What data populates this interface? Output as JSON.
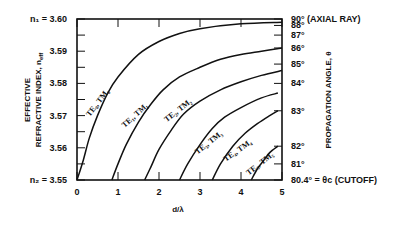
{
  "chart_data": {
    "type": "line",
    "title": "",
    "xlabel": "d/λ",
    "ylabel": "EFFECTIVE REFRACTIVE INDEX, n_eff",
    "ylabel_line1": "EFFECTIVE",
    "ylabel_line2": "REFRACTIVE INDEX, n",
    "ylabel_sub": "eff",
    "y2label": "PROPAGATION ANGLE, θ",
    "xlim": [
      0,
      5
    ],
    "ylim": [
      3.55,
      3.6
    ],
    "x_ticks": [
      0,
      1,
      2,
      3,
      4,
      5
    ],
    "x_tick_labels": [
      "0",
      "1",
      "2",
      "3",
      "4",
      "5"
    ],
    "y_ticks": [
      3.55,
      3.56,
      3.57,
      3.58,
      3.59,
      3.6
    ],
    "y_tick_labels": [
      "n₂ = 3.55",
      "3.56",
      "3.57",
      "3.58",
      "3.59",
      "n₁ = 3.60"
    ],
    "y2_ticks": [
      {
        "angle": 90,
        "n": 3.6,
        "label": "90° (AXIAL RAY)"
      },
      {
        "angle": 88,
        "n": 3.598,
        "label": "88°"
      },
      {
        "angle": 87,
        "n": 3.595,
        "label": "87°"
      },
      {
        "angle": 86,
        "n": 3.591,
        "label": "86°"
      },
      {
        "angle": 85,
        "n": 3.586,
        "label": "85°"
      },
      {
        "angle": 84,
        "n": 3.58,
        "label": "84°"
      },
      {
        "angle": 83,
        "n": 3.5715,
        "label": "83°"
      },
      {
        "angle": 82,
        "n": 3.5605,
        "label": "82°"
      },
      {
        "angle": 81,
        "n": 3.555,
        "label": "81°"
      },
      {
        "angle": 80.4,
        "n": 3.55,
        "label": "80.4° = θc  (CUTOFF)"
      }
    ],
    "grid": false,
    "series": [
      {
        "name": "TE₀, TM₀",
        "x": [
          0,
          0.15,
          0.3,
          0.5,
          0.75,
          1.0,
          1.5,
          2.0,
          2.5,
          3.0,
          4.0,
          5.0
        ],
        "y": [
          3.55,
          3.556,
          3.563,
          3.57,
          3.577,
          3.582,
          3.589,
          3.593,
          3.5955,
          3.597,
          3.5985,
          3.599
        ]
      },
      {
        "name": "TE₁, TM₁",
        "x": [
          0.85,
          1.0,
          1.2,
          1.5,
          1.8,
          2.1,
          2.5,
          3.0,
          3.5,
          4.0,
          4.5,
          5.0
        ],
        "y": [
          3.55,
          3.555,
          3.561,
          3.568,
          3.5735,
          3.578,
          3.582,
          3.585,
          3.5875,
          3.589,
          3.59,
          3.591
        ]
      },
      {
        "name": "TE₂, TM₂",
        "x": [
          1.65,
          1.8,
          2.0,
          2.3,
          2.6,
          3.0,
          3.5,
          4.0,
          4.5,
          5.0
        ],
        "y": [
          3.55,
          3.554,
          3.5595,
          3.5655,
          3.5705,
          3.5745,
          3.578,
          3.5805,
          3.5825,
          3.584
        ]
      },
      {
        "name": "TE₃, TM₃",
        "x": [
          2.5,
          2.7,
          3.0,
          3.3,
          3.6,
          4.0,
          4.5,
          4.9
        ],
        "y": [
          3.55,
          3.555,
          3.561,
          3.566,
          3.5695,
          3.5725,
          3.5755,
          3.577
        ]
      },
      {
        "name": "TE₄, TM₄",
        "x": [
          3.3,
          3.5,
          3.8,
          4.1,
          4.4,
          4.7,
          4.9
        ],
        "y": [
          3.55,
          3.555,
          3.5605,
          3.5645,
          3.5675,
          3.57,
          3.5715
        ]
      },
      {
        "name": "TE₅, TM₅",
        "x": [
          4.25,
          4.4,
          4.55,
          4.7,
          4.9
        ],
        "y": [
          3.55,
          3.5535,
          3.556,
          3.5585,
          3.5605
        ]
      }
    ],
    "curve_labels": [
      "TE₀, TM₀",
      "TE₁, TM₁",
      "TE₂, TM₂",
      "TE₃, TM₃",
      "TE₄, TM₄",
      "TE₅, TM₅"
    ],
    "legend": "none"
  }
}
